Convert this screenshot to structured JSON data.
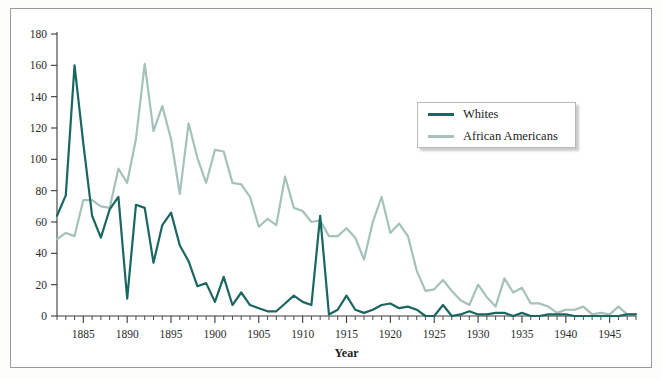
{
  "chart_data": {
    "type": "line",
    "title": "",
    "xlabel": "Year",
    "ylabel": "",
    "xlim": [
      1882,
      1948
    ],
    "ylim": [
      0,
      180
    ],
    "ytick_step": 20,
    "yticks": [
      0,
      20,
      40,
      60,
      80,
      100,
      120,
      140,
      160,
      180
    ],
    "xticks": [
      1885,
      1890,
      1895,
      1900,
      1905,
      1910,
      1915,
      1920,
      1925,
      1930,
      1935,
      1940,
      1945
    ],
    "minor_xtick_interval": 1,
    "grid": false,
    "legend_position": "upper-right-inside",
    "x": [
      1882,
      1883,
      1884,
      1885,
      1886,
      1887,
      1888,
      1889,
      1890,
      1891,
      1892,
      1893,
      1894,
      1895,
      1896,
      1897,
      1898,
      1899,
      1900,
      1901,
      1902,
      1903,
      1904,
      1905,
      1906,
      1907,
      1908,
      1909,
      1910,
      1911,
      1912,
      1913,
      1914,
      1915,
      1916,
      1917,
      1918,
      1919,
      1920,
      1921,
      1922,
      1923,
      1924,
      1925,
      1926,
      1927,
      1928,
      1929,
      1930,
      1931,
      1932,
      1933,
      1934,
      1935,
      1936,
      1937,
      1938,
      1939,
      1940,
      1941,
      1942,
      1943,
      1944,
      1945,
      1946,
      1947,
      1948
    ],
    "series": [
      {
        "name": "Whites",
        "color": "#1a6660",
        "values": [
          64,
          77,
          160,
          110,
          64,
          50,
          68,
          76,
          11,
          71,
          69,
          34,
          58,
          66,
          45,
          35,
          19,
          21,
          9,
          25,
          7,
          15,
          7,
          5,
          3,
          3,
          8,
          13,
          9,
          7,
          64,
          1,
          4,
          13,
          4,
          2,
          4,
          7,
          8,
          5,
          6,
          4,
          0,
          0,
          7,
          0,
          1,
          3,
          1,
          1,
          2,
          2,
          0,
          2,
          0,
          0,
          1,
          1,
          1,
          0,
          0,
          0,
          0,
          0,
          0,
          1,
          1
        ]
      },
      {
        "name": "African Americans",
        "color": "#a4c2bb",
        "values": [
          49,
          53,
          51,
          74,
          74,
          70,
          69,
          94,
          85,
          113,
          161,
          118,
          134,
          113,
          78,
          123,
          101,
          85,
          106,
          105,
          85,
          84,
          76,
          57,
          62,
          58,
          89,
          69,
          67,
          60,
          61,
          51,
          51,
          56,
          50,
          36,
          60,
          76,
          53,
          59,
          51,
          29,
          16,
          17,
          23,
          16,
          10,
          7,
          20,
          12,
          6,
          24,
          15,
          18,
          8,
          8,
          6,
          2,
          4,
          4,
          6,
          1,
          2,
          1,
          6,
          1,
          1
        ]
      }
    ]
  },
  "legend": {
    "entries": [
      {
        "label": "Whites",
        "color": "#1a6660"
      },
      {
        "label": "African Americans",
        "color": "#a4c2bb"
      }
    ]
  },
  "axes": {
    "x_title": "Year"
  }
}
